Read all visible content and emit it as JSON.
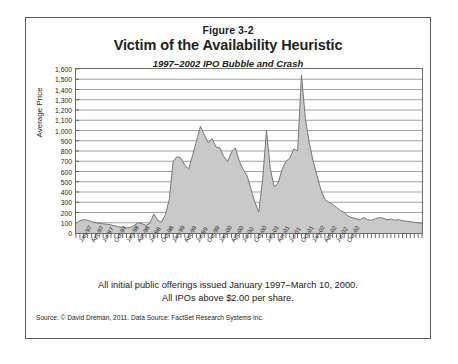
{
  "figure": {
    "number": "Figure 3-2",
    "title": "Victim of the Availability Heuristic",
    "subtitle": "1997–2002 IPO Bubble and Crash",
    "note_line1": "All initial public offerings issued January 1997–March 10, 2000.",
    "note_line2": "All IPOs above $2.00 per share.",
    "source": "Source: © David Dreman, 2011. Data Source: FactSet Research Systems Inc.",
    "border_color": "#5b5b5b"
  },
  "chart_data": {
    "type": "area",
    "title": "Victim of the Availability Heuristic",
    "subtitle": "1997–2002 IPO Bubble and Crash",
    "xlabel": "",
    "ylabel": "Average Price",
    "ylim": [
      0,
      1600
    ],
    "ytick_step": 100,
    "ytick_labels": [
      "1,600",
      "1,500",
      "1,400",
      "1,300",
      "1,200",
      "1,100",
      "1,000",
      "900",
      "800",
      "700",
      "600",
      "500",
      "400",
      "300",
      "200",
      "100",
      "0"
    ],
    "grid": true,
    "grid_axis": "y",
    "legend": "none",
    "fill_color": "#c9c9c9",
    "line_color": "#6b6b6b",
    "tick_interval": "monthly",
    "label_interval": "quarterly",
    "xtick_labels": [
      "Jan-97",
      "Apr-97",
      "Jul-97",
      "Oct-97",
      "Jan-98",
      "Apr-98",
      "Jul-98",
      "Oct-98",
      "Jan-99",
      "Apr-99",
      "Jul-99",
      "Oct-99",
      "Jan-00",
      "Apr-00",
      "Jul-00",
      "Oct-00",
      "Jan-01",
      "Apr-01",
      "Jul-01",
      "Oct-01",
      "Jan-02",
      "Apr-02",
      "Jul-02",
      "Oct-02"
    ],
    "x": [
      "Jan-97",
      "Feb-97",
      "Mar-97",
      "Apr-97",
      "May-97",
      "Jun-97",
      "Jul-97",
      "Aug-97",
      "Sep-97",
      "Oct-97",
      "Nov-97",
      "Dec-97",
      "Jan-98",
      "Feb-98",
      "Mar-98",
      "Apr-98",
      "May-98",
      "Jun-98",
      "Jul-98",
      "Aug-98",
      "Sep-98",
      "Oct-98",
      "Nov-98",
      "Dec-98",
      "Jan-99",
      "Feb-99",
      "Mar-99",
      "Apr-99",
      "May-99",
      "Jun-99",
      "Jul-99",
      "Aug-99",
      "Sep-99",
      "Oct-99",
      "Nov-99",
      "Dec-99",
      "Jan-00",
      "Feb-00",
      "Mar-00",
      "Apr-00",
      "May-00",
      "Jun-00",
      "Jul-00",
      "Aug-00",
      "Sep-00",
      "Oct-00",
      "Nov-00",
      "Dec-00",
      "Jan-01",
      "Feb-01",
      "Mar-01",
      "Apr-01",
      "May-01",
      "Jun-01",
      "Jul-01",
      "Aug-01",
      "Sep-01",
      "Oct-01",
      "Nov-01",
      "Dec-01",
      "Jan-02",
      "Feb-02",
      "Mar-02",
      "Apr-02",
      "May-02",
      "Jun-02",
      "Jul-02",
      "Aug-02",
      "Sep-02",
      "Oct-02"
    ],
    "values": [
      95,
      120,
      130,
      125,
      110,
      100,
      95,
      90,
      85,
      80,
      70,
      60,
      55,
      50,
      55,
      75,
      100,
      90,
      75,
      95,
      185,
      125,
      105,
      180,
      330,
      700,
      745,
      730,
      660,
      625,
      760,
      900,
      1040,
      960,
      880,
      920,
      840,
      830,
      745,
      700,
      790,
      830,
      700,
      620,
      560,
      430,
      300,
      205,
      520,
      1000,
      620,
      450,
      490,
      620,
      700,
      730,
      820,
      800,
      1540,
      1120,
      880,
      700,
      560,
      420,
      330,
      300,
      280,
      250,
      220,
      200
    ],
    "series_note": "Monthly average IPO price; sharp spike at March 2000 peak (~1,540), decline thereafter to ~100–150 through 2002",
    "tail_values": [
      165,
      150,
      140,
      130,
      150,
      130,
      125,
      140,
      150,
      145,
      130,
      135,
      125,
      130,
      120,
      115,
      110,
      105,
      100,
      95
    ]
  }
}
